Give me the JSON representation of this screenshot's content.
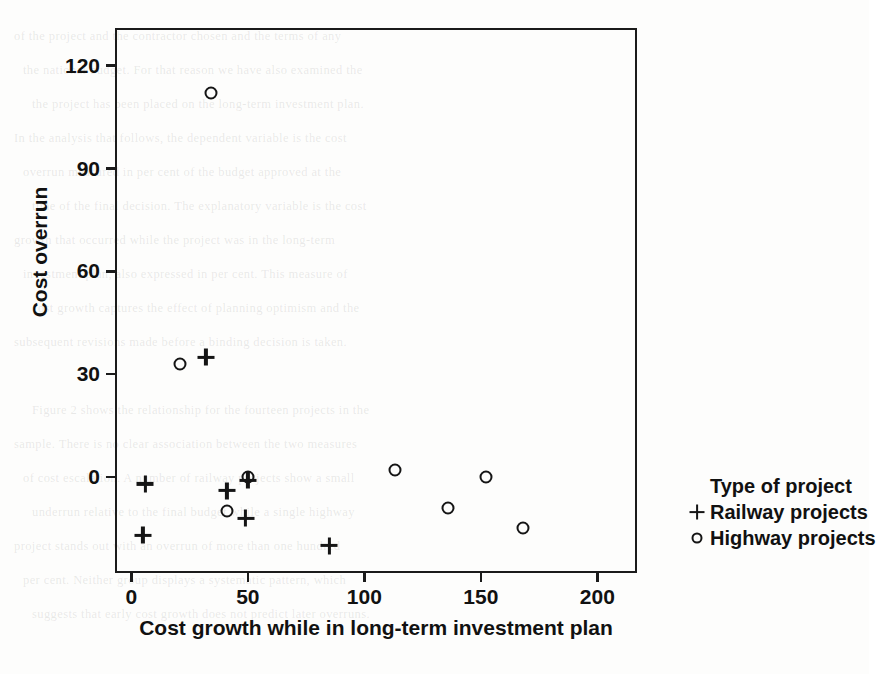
{
  "chart_data": {
    "type": "scatter",
    "title": "",
    "xlabel": "Cost growth while in long-term investment plan",
    "ylabel": "Cost overrun",
    "xlim": [
      -7,
      217
    ],
    "ylim": [
      -28,
      131
    ],
    "grid": false,
    "xticks": [
      0,
      50,
      100,
      150,
      200
    ],
    "xticklabels": [
      "0",
      "50",
      "100",
      "150",
      "200"
    ],
    "yticks": [
      0,
      30,
      60,
      90,
      120
    ],
    "yticklabels": [
      "0",
      "30",
      "60",
      "90",
      "120"
    ],
    "legend": {
      "position": "right",
      "title": "Type of project",
      "entries": [
        {
          "label": "Railway projects",
          "marker": "plus"
        },
        {
          "label": "Highway projects",
          "marker": "circle"
        }
      ]
    },
    "series": [
      {
        "name": "Railway projects",
        "marker": "plus",
        "points": [
          {
            "x": 6,
            "y": -2
          },
          {
            "x": 5,
            "y": -17
          },
          {
            "x": 32,
            "y": 35
          },
          {
            "x": 41,
            "y": -4
          },
          {
            "x": 50,
            "y": -1
          },
          {
            "x": 49,
            "y": -12
          },
          {
            "x": 85,
            "y": -20
          }
        ]
      },
      {
        "name": "Highway projects",
        "marker": "circle",
        "points": [
          {
            "x": 34,
            "y": 112
          },
          {
            "x": 21,
            "y": 33
          },
          {
            "x": 41,
            "y": -10
          },
          {
            "x": 50,
            "y": 0
          },
          {
            "x": 113,
            "y": 2
          },
          {
            "x": 136,
            "y": -9
          },
          {
            "x": 152,
            "y": 0
          },
          {
            "x": 168,
            "y": -15
          }
        ]
      }
    ]
  },
  "page_background": {
    "lines": [
      "of the project and the contractor chosen and the terms of any",
      "the national budget. For that reason we have also examined the",
      "the project has been placed on the long-term investment plan.",
      "In the analysis that follows, the dependent variable is the cost",
      "overrun measured in per cent of the budget approved at the",
      "time of the final decision. The explanatory variable is the cost",
      "growth that occurred while the project was in the long-term",
      "investment plan, also expressed in per cent. This measure of",
      "cost growth captures the effect of planning optimism and the",
      "subsequent revisions made before a binding decision is taken.",
      "",
      "Figure 2 shows the relationship for the fourteen projects in the",
      "sample. There is no clear association between the two measures",
      "of cost escalation. A number of railway projects show a small",
      "underrun relative to the final budget while a single highway",
      "project stands out with an overrun of more than one hundred",
      "per cent. Neither group displays a systematic pattern, which",
      "suggests that early cost growth does not predict later overruns."
    ]
  }
}
